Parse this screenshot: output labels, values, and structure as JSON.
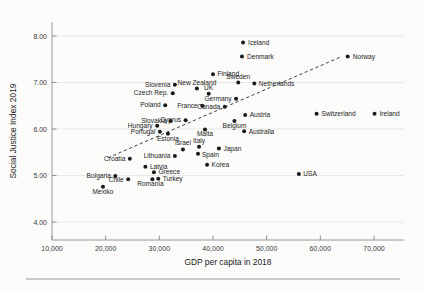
{
  "chart_data": {
    "type": "scatter",
    "title": "",
    "xlabel": "GDP per capita in 2018",
    "ylabel": "Social Justice Index 2019",
    "xlim": [
      8000,
      76000
    ],
    "ylim": [
      3.75,
      8.35
    ],
    "xticks": [
      10000,
      20000,
      30000,
      40000,
      50000,
      60000,
      70000
    ],
    "xticklabels": [
      "10,000",
      "20,000",
      "30,000",
      "40,000",
      "50,000",
      "60,000",
      "70,000"
    ],
    "yticks": [
      4.0,
      5.0,
      6.0,
      7.0,
      8.0
    ],
    "yticklabels": [
      "4.00",
      "5.00",
      "6.00",
      "7.00",
      "8.00"
    ],
    "grid": "horizontal",
    "legend": "none",
    "trendline": {
      "type": "linear-dashed",
      "x0": 20400,
      "y0": 5.38,
      "x1": 63600,
      "y1": 7.54
    },
    "points": [
      {
        "label": "Iceland",
        "x": 45600,
        "y": 7.86,
        "label_dx": 5,
        "label_dy": 2.2,
        "anchor": "start"
      },
      {
        "label": "Denmark",
        "x": 45400,
        "y": 7.56,
        "label_dx": 5,
        "label_dy": 2.2,
        "anchor": "start"
      },
      {
        "label": "Norway",
        "x": 65100,
        "y": 7.56,
        "label_dx": 5,
        "label_dy": 2.2,
        "anchor": "start"
      },
      {
        "label": "Finland",
        "x": 40000,
        "y": 7.18,
        "label_dx": 4.5,
        "label_dy": 2.2,
        "anchor": "start"
      },
      {
        "label": "Sweden",
        "x": 44700,
        "y": 7.0,
        "label_dx": 0,
        "label_dy": -4.0,
        "anchor": "middle"
      },
      {
        "label": "Netherlands",
        "x": 47700,
        "y": 6.98,
        "label_dx": 4.5,
        "label_dy": 2.2,
        "anchor": "start"
      },
      {
        "label": "Slovenia",
        "x": 32900,
        "y": 6.95,
        "label_dx": -4.5,
        "label_dy": 2.2,
        "anchor": "end"
      },
      {
        "label": "New Zealand",
        "x": 37000,
        "y": 6.87,
        "label_dx": 0,
        "label_dy": -4.0,
        "anchor": "middle"
      },
      {
        "label": "Czech Rep.",
        "x": 32500,
        "y": 6.77,
        "label_dx": -4.5,
        "label_dy": 2.2,
        "anchor": "end"
      },
      {
        "label": "UK",
        "x": 39200,
        "y": 6.76,
        "label_dx": 0,
        "label_dy": -4.0,
        "anchor": "middle"
      },
      {
        "label": "Germany",
        "x": 44300,
        "y": 6.65,
        "label_dx": -4.5,
        "label_dy": 2.2,
        "anchor": "end"
      },
      {
        "label": "Poland",
        "x": 31100,
        "y": 6.51,
        "label_dx": -4.5,
        "label_dy": 2.2,
        "anchor": "end"
      },
      {
        "label": "France",
        "x": 38000,
        "y": 6.5,
        "label_dx": -4.5,
        "label_dy": 2.2,
        "anchor": "end"
      },
      {
        "label": "Canada",
        "x": 42200,
        "y": 6.48,
        "label_dx": -4.5,
        "label_dy": 2.2,
        "anchor": "end"
      },
      {
        "label": "Switzerland",
        "x": 59300,
        "y": 6.33,
        "label_dx": 5,
        "label_dy": 2.2,
        "anchor": "start"
      },
      {
        "label": "Ireland",
        "x": 70100,
        "y": 6.33,
        "label_dx": 5,
        "label_dy": 2.2,
        "anchor": "start"
      },
      {
        "label": "Austria",
        "x": 46000,
        "y": 6.3,
        "label_dx": 4.5,
        "label_dy": 2.2,
        "anchor": "start"
      },
      {
        "label": "Cyprus",
        "x": 34900,
        "y": 6.19,
        "label_dx": -4.5,
        "label_dy": 2.2,
        "anchor": "end"
      },
      {
        "label": "Slovakia",
        "x": 32100,
        "y": 6.17,
        "label_dx": -4.5,
        "label_dy": 2.2,
        "anchor": "end"
      },
      {
        "label": "Belgium",
        "x": 44000,
        "y": 6.17,
        "label_dx": 0,
        "label_dy": 7.0,
        "anchor": "middle"
      },
      {
        "label": "Hungary",
        "x": 29600,
        "y": 6.07,
        "label_dx": -4.5,
        "label_dy": 2.2,
        "anchor": "end"
      },
      {
        "label": "Malta",
        "x": 38500,
        "y": 5.99,
        "label_dx": 0,
        "label_dy": 7.0,
        "anchor": "middle"
      },
      {
        "label": "Australia",
        "x": 45800,
        "y": 5.95,
        "label_dx": 4.5,
        "label_dy": 2.2,
        "anchor": "start"
      },
      {
        "label": "Portugal",
        "x": 30100,
        "y": 5.94,
        "label_dx": -4.5,
        "label_dy": 2.2,
        "anchor": "end"
      },
      {
        "label": "Estonia",
        "x": 31600,
        "y": 5.9,
        "label_dx": 0,
        "label_dy": 7.0,
        "anchor": "middle"
      },
      {
        "label": "Italy",
        "x": 37400,
        "y": 5.62,
        "label_dx": 0,
        "label_dy": -4.0,
        "anchor": "middle"
      },
      {
        "label": "Japan",
        "x": 41100,
        "y": 5.58,
        "label_dx": 4.5,
        "label_dy": 2.2,
        "anchor": "start"
      },
      {
        "label": "Israel",
        "x": 34400,
        "y": 5.56,
        "label_dx": 0,
        "label_dy": -4.0,
        "anchor": "middle"
      },
      {
        "label": "Spain",
        "x": 37200,
        "y": 5.47,
        "label_dx": 4.0,
        "label_dy": 3.0,
        "anchor": "start"
      },
      {
        "label": "Lithuania",
        "x": 32900,
        "y": 5.42,
        "label_dx": -4.5,
        "label_dy": 2.2,
        "anchor": "end"
      },
      {
        "label": "Croatia",
        "x": 24500,
        "y": 5.36,
        "label_dx": -4.5,
        "label_dy": 2.2,
        "anchor": "end"
      },
      {
        "label": "Korea",
        "x": 38900,
        "y": 5.23,
        "label_dx": 4.5,
        "label_dy": 2.2,
        "anchor": "start"
      },
      {
        "label": "Latvia",
        "x": 27400,
        "y": 5.19,
        "label_dx": 4.5,
        "label_dy": 2.2,
        "anchor": "start"
      },
      {
        "label": "Greece",
        "x": 29000,
        "y": 5.07,
        "label_dx": 4.5,
        "label_dy": 2.2,
        "anchor": "start"
      },
      {
        "label": "USA",
        "x": 56000,
        "y": 5.03,
        "label_dx": 4.5,
        "label_dy": 2.2,
        "anchor": "start"
      },
      {
        "label": "Bulgaria",
        "x": 21800,
        "y": 4.99,
        "label_dx": -4.5,
        "label_dy": 2.2,
        "anchor": "end"
      },
      {
        "label": "Turkey",
        "x": 29800,
        "y": 4.93,
        "label_dx": 4.5,
        "label_dy": 2.2,
        "anchor": "start"
      },
      {
        "label": "Romania",
        "x": 28700,
        "y": 4.92,
        "label_dx": -2.0,
        "label_dy": 7.0,
        "anchor": "middle"
      },
      {
        "label": "Chile",
        "x": 24200,
        "y": 4.92,
        "label_dx": -4.5,
        "label_dy": 3.2,
        "anchor": "end"
      },
      {
        "label": "Mexiko",
        "x": 19500,
        "y": 4.76,
        "label_dx": 0,
        "label_dy": 7.5,
        "anchor": "middle"
      }
    ]
  }
}
